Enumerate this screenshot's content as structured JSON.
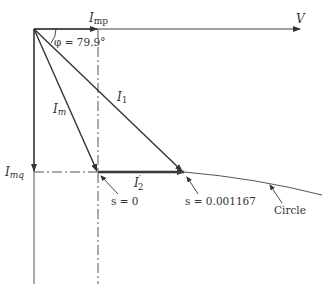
{
  "diagram": {
    "labels": {
      "voltage": "V",
      "i_mp": "I",
      "i_mp_sub": "mp",
      "phi": "φ = 79.9°",
      "i_m": "I",
      "i_m_sub": "m",
      "i_1": "I",
      "i_1_sub": "1",
      "i_mq": "I",
      "i_mq_sub": "mq",
      "i_2": "I",
      "i_2_sup": "′",
      "i_2_sub": "2",
      "slip_zero": "s = 0",
      "slip_value": "s = 0.001167",
      "circle": "Circle"
    },
    "colors": {
      "line": "#333333",
      "dashdot": "#555555"
    }
  }
}
